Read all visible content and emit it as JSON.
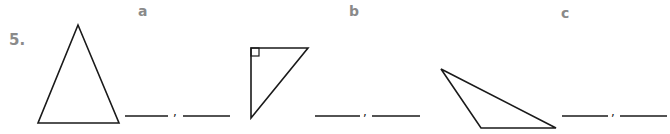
{
  "question": {
    "number": "5."
  },
  "items": [
    {
      "label": "a",
      "shape": "acute-isosceles-triangle",
      "blank_separator": ","
    },
    {
      "label": "b",
      "shape": "right-triangle",
      "blank_separator": ","
    },
    {
      "label": "c",
      "shape": "obtuse-triangle",
      "blank_separator": ","
    }
  ],
  "colors": {
    "label": "#8a8a8a",
    "stroke": "#1a1a1a"
  }
}
